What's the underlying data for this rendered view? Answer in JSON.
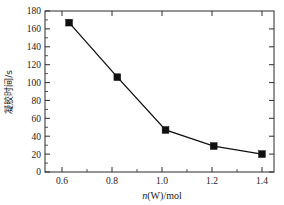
{
  "chart_data": {
    "type": "line",
    "title": "",
    "subtitle": "",
    "xlabel": "n(W)/mol",
    "xlabel_italic_part": "n",
    "xlabel_rest": "(W)/mol",
    "ylabel": "凝胶时间/s",
    "x": [
      0.6,
      0.8,
      1.0,
      1.2,
      1.4
    ],
    "values": [
      167,
      106,
      47,
      29,
      20
    ],
    "series": [
      {
        "name": "凝胶时间",
        "values": [
          167,
          106,
          47,
          29,
          20
        ],
        "marker": "filled-square",
        "color": "#101010"
      }
    ],
    "xlim": [
      0.5,
      1.45
    ],
    "ylim": [
      0,
      180
    ],
    "xticks": [
      0.6,
      0.8,
      1.0,
      1.2,
      1.4
    ],
    "xtick_labels": [
      "0.6",
      "0.8",
      "1.0",
      "1.2",
      "1.4"
    ],
    "yticks": [
      0,
      20,
      40,
      60,
      80,
      100,
      120,
      140,
      160,
      180
    ],
    "ytick_labels": [
      "0",
      "20",
      "40",
      "60",
      "80",
      "100",
      "120",
      "140",
      "160",
      "180"
    ],
    "x_minor_ticks_per_interval": 1,
    "y_minor_ticks_per_interval": 1,
    "grid": false,
    "legend": false,
    "legend_position": "none",
    "frame": "box",
    "tick_direction": "in",
    "background_color": "#ffffff",
    "axis_color": "#2b2b2b",
    "annotations": []
  },
  "axes": {
    "y_tick_0": "0",
    "y_tick_1": "20",
    "y_tick_2": "40",
    "y_tick_3": "60",
    "y_tick_4": "80",
    "y_tick_5": "100",
    "y_tick_6": "120",
    "y_tick_7": "140",
    "y_tick_8": "160",
    "y_tick_9": "180",
    "x_tick_0": "0.6",
    "x_tick_1": "0.8",
    "x_tick_2": "1.0",
    "x_tick_3": "1.2",
    "x_tick_4": "1.4",
    "x_axis_title_italic": "n",
    "x_axis_title_rest": "(W)/mol",
    "y_axis_title": "凝胶时间/s"
  }
}
